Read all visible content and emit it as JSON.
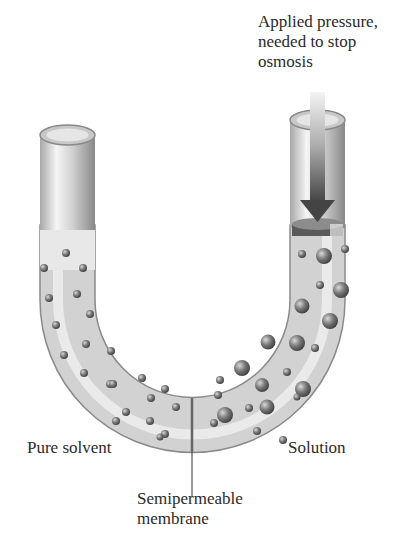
{
  "diagram": {
    "labels": {
      "applied_pressure": [
        "Applied pressure,",
        "needed to stop",
        "osmosis"
      ],
      "pure_solvent": "Pure solvent",
      "solution": "Solution",
      "membrane": [
        "Semipermeable",
        "membrane"
      ]
    },
    "colors": {
      "tube_light": "#e4e4e4",
      "tube_dark": "#9a9a9a",
      "particle": "#707070",
      "arrow": "#555555",
      "text": "#2a2a2a"
    },
    "components": [
      "u-tube",
      "pure-solvent-side",
      "solution-side",
      "semipermeable-membrane",
      "piston",
      "pressure-arrow"
    ]
  }
}
